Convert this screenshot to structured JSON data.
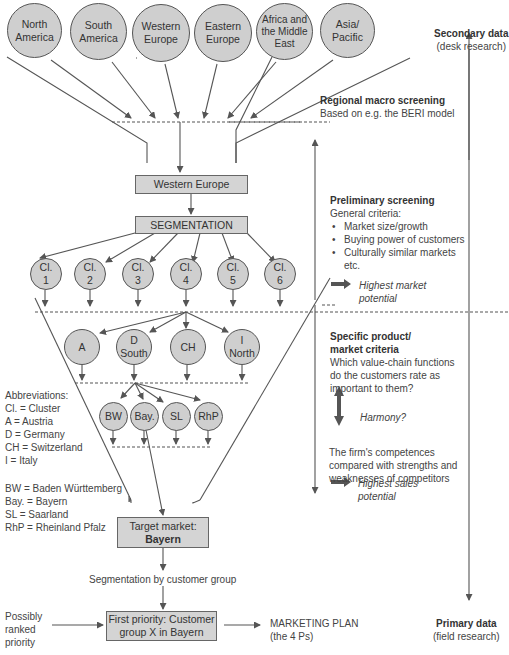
{
  "regions": [
    "North\nAmerica",
    "South\nAmerica",
    "Western\nEurope",
    "Eastern\nEurope",
    "Africa and\nthe Middle\nEast",
    "Asia/\nPacific"
  ],
  "boxes": {
    "western_europe": "Western Europe",
    "segmentation": "SEGMENTATION",
    "target_market_line1": "Target market:",
    "target_market_line2": "Bayern",
    "first_priority_line1": "First priority: Customer",
    "first_priority_line2": "group X in Bayern"
  },
  "clusters": [
    "Cl.\n1",
    "Cl.\n2",
    "Cl.\n3",
    "Cl.\n4",
    "Cl.\n5",
    "Cl.\n6"
  ],
  "countries": [
    "A",
    "D\nSouth",
    "CH",
    "I\nNorth"
  ],
  "states": [
    "BW",
    "Bay.",
    "SL",
    "RhP"
  ],
  "right_panel": {
    "secondary_title": "Secondary data",
    "secondary_sub": "(desk research)",
    "regional_title": "Regional macro screening",
    "regional_sub": "Based on e.g. the BERI model",
    "preliminary_title": "Preliminary screening",
    "preliminary_sub": "General criteria:",
    "preliminary_bullets": [
      "Market size/growth",
      "Buying power of customers",
      "Culturally similar markets"
    ],
    "preliminary_etc": "etc.",
    "highest_market_1": "Highest market",
    "highest_market_2": "potential",
    "specific_title_1": "Specific product/",
    "specific_title_2": "market criteria",
    "specific_q_1": "Which value-chain functions",
    "specific_q_2": "do the customers rate as",
    "specific_q_3": "important to them?",
    "harmony": "Harmony?",
    "firm_1": "The firm's competences",
    "firm_2": "compared with strengths and",
    "firm_3": "weaknesses of competitors",
    "highest_sales_1": "Highest sales",
    "highest_sales_2": "potential",
    "primary_title": "Primary data",
    "primary_sub": "(field research)"
  },
  "abbreviations": {
    "title": "Abbreviations:",
    "items": [
      "Cl. = Cluster",
      "A = Austria",
      "D = Germany",
      "CH = Switzerland",
      "I = Italy"
    ],
    "items2": [
      "BW = Baden Württemberg",
      "Bay. = Bayern",
      "SL = Saarland",
      "RhP = Rheinland Pfalz"
    ]
  },
  "bottom": {
    "segmentation_by": "Segmentation by customer group",
    "possibly_1": "Possibly",
    "possibly_2": "ranked",
    "possibly_3": "priority",
    "marketing_1": "MARKETING PLAN",
    "marketing_2": "(the 4 Ps)"
  }
}
